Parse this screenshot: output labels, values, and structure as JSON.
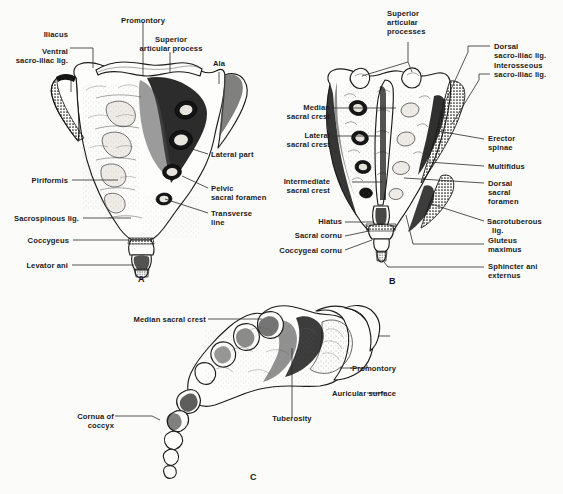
{
  "figure": {
    "background_color": "#fbfbfa",
    "ink_color": "#1b1b1b",
    "panels": [
      {
        "id": "A",
        "letter": "A",
        "view": "anterior (pelvic) surface of sacrum and coccyx",
        "labels": [
          "Promontory",
          "Superior\narticular process",
          "Ala",
          "Iliacus",
          "Ventral\nsacro-iliac lig.",
          "Lateral part",
          "Pelvic\nsacral foramen",
          "Transverse\nline",
          "Piriformis",
          "Sacrospinous lig.",
          "Coccygeus",
          "Levator ani"
        ]
      },
      {
        "id": "B",
        "letter": "B",
        "view": "posterior (dorsal) surface of sacrum and coccyx",
        "labels": [
          "Superior\narticular\nprocesses",
          "Dorsal\nsacro-iliac lig.",
          "Interosseous\nsacro-iliac lig.",
          "Median\nsacral crest",
          "Lateral\nsacral crest",
          "Erector\nspinae",
          "Multifidus",
          "Dorsal\nsacral\nforamen",
          "Intermediate\nsacral crest",
          "Sacrotuberous\nlig.",
          "Gluteus\nmaximus",
          "Hiatus",
          "Sacral cornu",
          "Coccygeal cornu",
          "Sphincter ani\nexternus"
        ]
      },
      {
        "id": "C",
        "letter": "C",
        "view": "lateral view of sacrum and coccyx",
        "labels": [
          "Median sacral crest",
          "Promontory",
          "Auricular surface",
          "Tuberosity",
          "Cornua of\ncoccyx"
        ]
      }
    ],
    "panelA": {
      "letter": "A",
      "lbl_promontory": "Promontory",
      "lbl_superior_articular_process_1": "Superior",
      "lbl_superior_articular_process_2": "articular process",
      "lbl_ala": "Ala",
      "lbl_iliacus": "Iliacus",
      "lbl_ventral_1": "Ventral",
      "lbl_ventral_2": "sacro-iliac lig.",
      "lbl_lateral_part": "Lateral part",
      "lbl_pelvic_foramen_1": "Pelvic",
      "lbl_pelvic_foramen_2": "sacral foramen",
      "lbl_transverse_1": "Transverse",
      "lbl_transverse_2": "line",
      "lbl_piriformis": "Piriformis",
      "lbl_sacrospinous": "Sacrospinous lig.",
      "lbl_coccygeus": "Coccygeus",
      "lbl_levator_ani": "Levator ani"
    },
    "panelB": {
      "letter": "B",
      "lbl_sup_art_1": "Superior",
      "lbl_sup_art_2": "articular",
      "lbl_sup_art_3": "processes",
      "lbl_dorsal_si_1": "Dorsal",
      "lbl_dorsal_si_2": "sacro-iliac lig.",
      "lbl_interosseous_1": "Interosseous",
      "lbl_interosseous_2": "sacro-iliac lig.",
      "lbl_median_1": "Median",
      "lbl_median_2": "sacral crest",
      "lbl_lateral_1": "Lateral",
      "lbl_lateral_2": "sacral crest",
      "lbl_erector_1": "Erector",
      "lbl_erector_2": "spinae",
      "lbl_multifidus": "Multifidus",
      "lbl_dorsal_for_1": "Dorsal",
      "lbl_dorsal_for_2": "sacral",
      "lbl_dorsal_for_3": "foramen",
      "lbl_intermediate_1": "Intermediate",
      "lbl_intermediate_2": "sacral crest",
      "lbl_sacrotuberous_1": "Sacrotuberous",
      "lbl_sacrotuberous_2": "lig.",
      "lbl_gluteus_1": "Gluteus",
      "lbl_gluteus_2": "maximus",
      "lbl_hiatus": "Hiatus",
      "lbl_sacral_cornu": "Sacral cornu",
      "lbl_coccygeal_cornu": "Coccygeal cornu",
      "lbl_sphincter_1": "Sphincter ani",
      "lbl_sphincter_2": "externus"
    },
    "panelC": {
      "letter": "C",
      "lbl_median_sacral_crest": "Median sacral crest",
      "lbl_promontory": "Promontory",
      "lbl_auricular_surface": "Auricular surface",
      "lbl_tuberosity": "Tuberosity",
      "lbl_cornua_1": "Cornua of",
      "lbl_cornua_2": "coccyx"
    }
  }
}
